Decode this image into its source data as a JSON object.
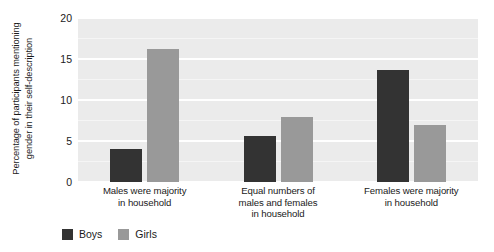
{
  "chart_data": {
    "type": "bar",
    "title": "",
    "subtitle": "",
    "xlabel": "",
    "ylabel": "Percentage of participants mentioning gender in their self-description",
    "ylabel_line1": "Percentage of participants mentioning",
    "ylabel_line2": "gender in their self-description",
    "ylim": [
      0,
      20
    ],
    "yticks": [
      0,
      5,
      10,
      15,
      20
    ],
    "ytick_labels": [
      "0",
      "5",
      "10",
      "15",
      "20"
    ],
    "grid": "horizontal-white-on-gray-panel",
    "legend_position": "bottom-left",
    "categories": [
      "Males were majority in household",
      "Equal numbers of males and females in household",
      "Females were majority in household"
    ],
    "category_lines": [
      [
        "Males were majority",
        "in household"
      ],
      [
        "Equal numbers of",
        "males and females",
        "in household"
      ],
      [
        "Females were majority",
        "in household"
      ]
    ],
    "series": [
      {
        "name": "Boys",
        "color": "#333333",
        "values": [
          4.0,
          5.6,
          13.7
        ]
      },
      {
        "name": "Girls",
        "color": "#999999",
        "values": [
          16.2,
          7.9,
          6.9
        ]
      }
    ],
    "panel_background": "#ebebeb",
    "gridline_color": "#ffffff",
    "figure_background": "#ffffff"
  },
  "legend": {
    "items": [
      {
        "label": "Boys",
        "color": "#333333"
      },
      {
        "label": "Girls",
        "color": "#999999"
      }
    ]
  }
}
